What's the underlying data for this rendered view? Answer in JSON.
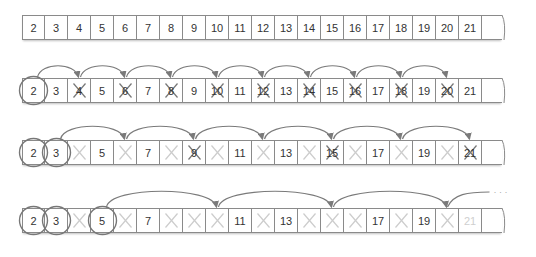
{
  "diagram": {
    "numbers": [
      "2",
      "3",
      "4",
      "5",
      "6",
      "7",
      "8",
      "9",
      "10",
      "11",
      "12",
      "13",
      "14",
      "15",
      "16",
      "17",
      "18",
      "19",
      "20",
      "21"
    ],
    "colors": {
      "border": "#8a8a8a",
      "text": "#333333",
      "cross_active": "#777777",
      "cross_faded": "#cccccc",
      "arc": "#7a7a7a",
      "circle": "#777777",
      "faded_text": "#cfcfcf"
    },
    "rows": [
      {
        "step": 0,
        "description": "Initial list 2..21",
        "circled": [],
        "crossed_now": [],
        "crossed_before": [],
        "arcs_from": null
      },
      {
        "step": 1,
        "description": "Prime 2: cross out multiples of 2",
        "circled": [
          "2"
        ],
        "crossed_now": [
          "4",
          "6",
          "8",
          "10",
          "12",
          "14",
          "16",
          "18",
          "20"
        ],
        "crossed_before": [],
        "arcs_from": "2",
        "arc_step": 2
      },
      {
        "step": 2,
        "description": "Prime 3: cross out multiples of 3",
        "circled": [
          "2",
          "3"
        ],
        "crossed_now": [
          "9",
          "15",
          "21"
        ],
        "crossed_before": [
          "4",
          "6",
          "8",
          "10",
          "12",
          "14",
          "16",
          "18",
          "20"
        ],
        "arcs_from": "3",
        "arc_step": 3
      },
      {
        "step": 3,
        "description": "Prime 5: cross out multiples of 5",
        "circled": [
          "2",
          "3",
          "5"
        ],
        "crossed_now": [],
        "crossed_before": [
          "4",
          "6",
          "8",
          "9",
          "10",
          "12",
          "14",
          "15",
          "16",
          "18",
          "20"
        ],
        "faded_numbers": [
          "21"
        ],
        "arcs_from": "5",
        "arc_step": 5,
        "continuation": "· · ·"
      }
    ]
  }
}
